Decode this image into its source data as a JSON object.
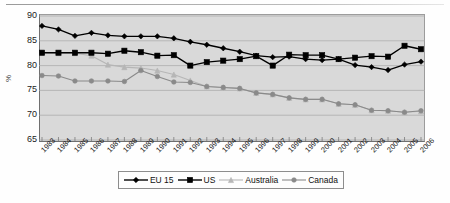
{
  "axis": {
    "ylabel": "%",
    "yticks": [
      90,
      85,
      80,
      75,
      70,
      65
    ],
    "ylim": [
      65,
      90
    ]
  },
  "legend": {
    "items": [
      {
        "label": "EU 15",
        "color": "#000000",
        "marker": "diamond"
      },
      {
        "label": "US",
        "color": "#000000",
        "marker": "square"
      },
      {
        "label": "Australia",
        "color": "#b6b6b6",
        "marker": "triangle"
      },
      {
        "label": "Canada",
        "color": "#8a8a8a",
        "marker": "circle"
      }
    ]
  },
  "chart_data": {
    "type": "line",
    "title": "",
    "xlabel": "",
    "ylabel": "%",
    "ylim": [
      65,
      90
    ],
    "yticks": [
      90,
      85,
      80,
      75,
      70,
      65
    ],
    "grid": true,
    "legend_position": "bottom",
    "categories": [
      "1983",
      "1984",
      "1985",
      "1986",
      "1987",
      "1988",
      "1989",
      "1990",
      "1991",
      "1992",
      "1993",
      "1994",
      "1995",
      "1996",
      "1997",
      "1998",
      "1999",
      "2000",
      "2001",
      "2002",
      "2003",
      "2004",
      "2005",
      "2006"
    ],
    "series": [
      {
        "name": "EU 15",
        "color": "#000000",
        "marker": "diamond",
        "values": [
          88.0,
          87.3,
          86.0,
          86.6,
          86.1,
          85.9,
          85.9,
          85.9,
          85.5,
          84.8,
          84.2,
          83.5,
          82.8,
          82.0,
          81.7,
          81.8,
          81.3,
          81.1,
          81.3,
          80.1,
          79.7,
          79.1,
          80.2,
          80.8
        ]
      },
      {
        "name": "US",
        "color": "#000000",
        "marker": "square",
        "values": [
          82.6,
          82.6,
          82.6,
          82.6,
          82.4,
          83.0,
          82.7,
          82.0,
          82.1,
          80.0,
          80.7,
          81.0,
          81.3,
          81.9,
          80.0,
          82.2,
          82.1,
          82.1,
          81.3,
          81.6,
          81.9,
          81.8,
          84.0,
          83.3
        ]
      },
      {
        "name": "Australia",
        "color": "#b6b6b6",
        "marker": "triangle",
        "values": [
          82.6,
          82.5,
          82.5,
          82.0,
          80.2,
          79.7,
          79.5,
          79.0,
          78.2,
          77.0,
          75.8,
          75.6,
          75.4,
          74.5,
          74.2,
          73.5,
          73.2,
          73.2,
          72.3,
          72.1,
          71.0,
          70.9,
          70.6,
          70.8
        ]
      },
      {
        "name": "Canada",
        "color": "#8a8a8a",
        "marker": "circle",
        "values": [
          78.0,
          77.9,
          76.9,
          76.9,
          76.9,
          76.8,
          79.0,
          77.8,
          76.7,
          76.6,
          75.8,
          75.6,
          75.4,
          74.5,
          74.2,
          73.5,
          73.2,
          73.2,
          72.3,
          72.1,
          71.0,
          70.9,
          70.6,
          70.9
        ]
      }
    ]
  }
}
